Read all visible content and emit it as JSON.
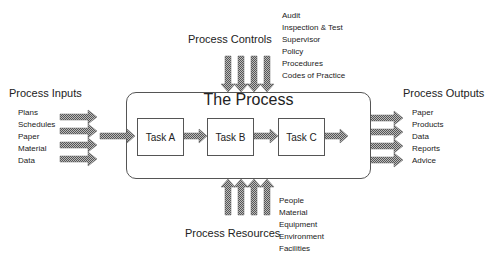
{
  "diagram": {
    "title": "The Process",
    "tasks": [
      "Task A",
      "Task B",
      "Task C"
    ],
    "inputs": {
      "title": "Process Inputs",
      "items": [
        "Plans",
        "Schedules",
        "Paper",
        "Material",
        "Data"
      ]
    },
    "controls": {
      "title": "Process Controls",
      "items": [
        "Audit",
        "Inspection & Test",
        "Supervisor",
        "Policy",
        "Procedures",
        "Codes of Practice"
      ]
    },
    "outputs": {
      "title": "Process Outputs",
      "items": [
        "Paper",
        "Products",
        "Data",
        "Reports",
        "Advice"
      ]
    },
    "resources": {
      "title": "Process Resources",
      "items": [
        "People",
        "Material",
        "Equipment",
        "Environment",
        "Facilities"
      ]
    },
    "colors": {
      "arrow_fill": "#8a8a8a",
      "border": "#555555"
    }
  }
}
